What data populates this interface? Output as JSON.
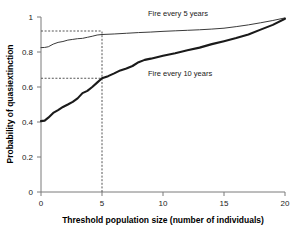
{
  "chart_data": {
    "type": "line",
    "title": "",
    "xlabel": "Threshold population size (number of individuals)",
    "ylabel": "Probability of quasiextinction",
    "xlim": [
      0,
      20
    ],
    "ylim": [
      0,
      1
    ],
    "xticks": [
      0,
      5,
      10,
      15,
      20
    ],
    "yticks": [
      0,
      0.2,
      0.4,
      0.6,
      0.8,
      1
    ],
    "xtick_labels": [
      "0",
      "5",
      "10",
      "15",
      "20"
    ],
    "ytick_labels": [
      "0",
      "0.2",
      "0.4",
      "0.6",
      "0.8",
      "1"
    ],
    "grid": false,
    "legend_position": "inline-annotation",
    "series": [
      {
        "name": "Fire every 5 years",
        "label": "Fire every 5 years",
        "style": "thin",
        "color": "#3a3a3a",
        "x": [
          0,
          0.3,
          0.6,
          1.0,
          1.4,
          1.8,
          2.2,
          2.6,
          3.0,
          3.4,
          3.8,
          4.2,
          4.6,
          5.0,
          6.0,
          7.0,
          8.0,
          9.0,
          10.0,
          11.0,
          12.0,
          13.0,
          14.0,
          15.0,
          16.0,
          17.0,
          18.0,
          19.0,
          20.0
        ],
        "y": [
          0.825,
          0.826,
          0.83,
          0.845,
          0.855,
          0.86,
          0.868,
          0.872,
          0.876,
          0.878,
          0.884,
          0.89,
          0.897,
          0.9,
          0.903,
          0.907,
          0.911,
          0.914,
          0.918,
          0.921,
          0.924,
          0.927,
          0.931,
          0.936,
          0.945,
          0.955,
          0.967,
          0.98,
          0.995
        ]
      },
      {
        "name": "Fire every 10 years",
        "label": "Fire every 10 years",
        "style": "thick",
        "color": "#1a1a1a",
        "x": [
          0,
          0.3,
          0.6,
          1.0,
          1.4,
          1.8,
          2.2,
          2.6,
          3.0,
          3.4,
          3.8,
          4.2,
          4.6,
          5.0,
          5.5,
          6.0,
          6.5,
          7.0,
          7.5,
          8.0,
          8.5,
          9.0,
          9.5,
          10.0,
          11.0,
          12.0,
          13.0,
          14.0,
          15.0,
          16.0,
          17.0,
          18.0,
          19.0,
          20.0
        ],
        "y": [
          0.405,
          0.408,
          0.425,
          0.452,
          0.468,
          0.486,
          0.5,
          0.515,
          0.535,
          0.565,
          0.578,
          0.6,
          0.625,
          0.65,
          0.662,
          0.678,
          0.695,
          0.706,
          0.72,
          0.742,
          0.755,
          0.762,
          0.77,
          0.778,
          0.793,
          0.81,
          0.825,
          0.845,
          0.862,
          0.88,
          0.9,
          0.928,
          0.955,
          0.99
        ]
      }
    ],
    "annotations": [
      {
        "name": "guide-horizontal-upper",
        "type": "dashed-horizontal",
        "y": 0.92,
        "x_from": 0,
        "x_to": 5
      },
      {
        "name": "guide-horizontal-lower",
        "type": "dashed-horizontal",
        "y": 0.65,
        "x_from": 0,
        "x_to": 5
      },
      {
        "name": "guide-vertical-threshold",
        "type": "dashed-vertical",
        "x": 5,
        "y_from": 0,
        "y_to": 0.92
      }
    ]
  },
  "labels": {
    "series_5yr": "Fire every 5 years",
    "series_10yr": "Fire every 10 years",
    "xaxis_title": "Threshold population size (number of individuals)",
    "yaxis_title": "Probability of quasiextinction",
    "x0": "0",
    "x5": "5",
    "x10": "10",
    "x15": "15",
    "x20": "20",
    "y0": "0",
    "y02": "0.2",
    "y04": "0.4",
    "y06": "0.6",
    "y08": "0.8",
    "y1": "1"
  },
  "colors": {
    "axis": "#7a7a7a",
    "thin_curve": "#3a3a3a",
    "thick_curve": "#1a1a1a",
    "dashed": "#555555",
    "text": "#111111"
  }
}
